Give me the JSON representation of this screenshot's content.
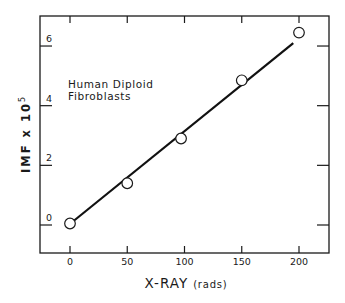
{
  "chart_data": {
    "type": "scatter",
    "title": "",
    "xlabel": "X-RAY",
    "xlabel_unit": "(rads)",
    "ylabel": "IMF x 10",
    "ylabel_exponent": "5",
    "xlim": [
      -25,
      225
    ],
    "ylim": [
      -1,
      7
    ],
    "x_ticks": [
      0,
      50,
      100,
      150,
      200
    ],
    "x_tick_labels": [
      "0",
      "50",
      "100",
      "150",
      "200"
    ],
    "y_ticks": [
      0,
      2,
      4,
      6
    ],
    "y_tick_labels": [
      "0",
      "2",
      "4",
      "6"
    ],
    "grid": false,
    "legend": null,
    "annotations": [
      "Human Diploid",
      "Fibroblasts"
    ],
    "series": [
      {
        "name": "Human Diploid Fibroblasts",
        "marker": "open-circle",
        "x": [
          0,
          50,
          97,
          150,
          200
        ],
        "y": [
          0.05,
          1.4,
          2.9,
          4.85,
          6.45
        ]
      },
      {
        "name": "linear fit",
        "style": "line",
        "x": [
          2,
          195
        ],
        "y": [
          0.1,
          6.1
        ]
      }
    ]
  },
  "colors": {
    "ink": "#1a1a1a",
    "background": "#ffffff"
  }
}
